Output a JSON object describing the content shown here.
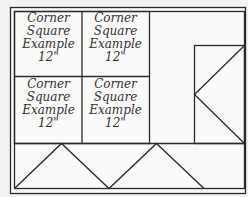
{
  "diagram": {
    "colors": {
      "line": "#2a2a2a",
      "background": "#f3f3f1",
      "panel": "#fafaf9",
      "text": "#333333"
    },
    "corner_squares": [
      {
        "lines": [
          "Corner",
          "Square",
          "Example",
          "12\""
        ]
      },
      {
        "lines": [
          "Corner",
          "Square",
          "Example",
          "12\""
        ]
      },
      {
        "lines": [
          "Corner",
          "Square",
          "Example",
          "12\""
        ]
      },
      {
        "lines": [
          "Corner",
          "Square",
          "Example",
          "12\""
        ]
      }
    ]
  }
}
